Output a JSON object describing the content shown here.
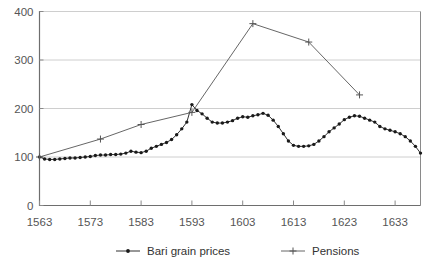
{
  "chart_data": {
    "type": "line",
    "title": "",
    "xlabel": "",
    "ylabel": "",
    "xlim": [
      1563,
      1638
    ],
    "ylim": [
      0,
      400
    ],
    "grid": true,
    "legend_position": "bottom",
    "yticks": [
      0,
      100,
      200,
      300,
      400
    ],
    "ytick_labels": [
      "0",
      "100",
      "200",
      "300",
      "400"
    ],
    "xticks": [
      1563,
      1573,
      1583,
      1593,
      1603,
      1613,
      1623,
      1633
    ],
    "xtick_labels": [
      "1563",
      "1573",
      "1583",
      "1593",
      "1603",
      "1613",
      "1623",
      "1633"
    ],
    "series": [
      {
        "name": "Bari grain prices",
        "marker": "dot",
        "color": "#1a1a1a",
        "x": [
          1563,
          1564,
          1565,
          1566,
          1567,
          1568,
          1569,
          1570,
          1571,
          1572,
          1573,
          1574,
          1575,
          1576,
          1577,
          1578,
          1579,
          1580,
          1581,
          1582,
          1583,
          1584,
          1585,
          1586,
          1587,
          1588,
          1589,
          1590,
          1591,
          1592,
          1593,
          1594,
          1595,
          1596,
          1597,
          1598,
          1599,
          1600,
          1601,
          1602,
          1603,
          1604,
          1605,
          1606,
          1607,
          1608,
          1609,
          1610,
          1611,
          1612,
          1613,
          1614,
          1615,
          1616,
          1617,
          1618,
          1619,
          1620,
          1621,
          1622,
          1623,
          1624,
          1625,
          1626,
          1627,
          1628,
          1629,
          1630,
          1631,
          1632,
          1633,
          1634,
          1635,
          1636,
          1637,
          1638
        ],
        "values": [
          100,
          96,
          95,
          95,
          96,
          97,
          98,
          98,
          99,
          100,
          101,
          103,
          104,
          104,
          105,
          105,
          106,
          108,
          112,
          110,
          109,
          112,
          118,
          122,
          126,
          130,
          136,
          146,
          158,
          172,
          208,
          196,
          189,
          180,
          172,
          170,
          170,
          172,
          175,
          180,
          183,
          182,
          185,
          187,
          190,
          186,
          176,
          163,
          148,
          133,
          124,
          122,
          122,
          123,
          126,
          133,
          142,
          152,
          160,
          168,
          177,
          182,
          185,
          184,
          180,
          176,
          172,
          163,
          158,
          155,
          152,
          148,
          142,
          133,
          122,
          108
        ]
      },
      {
        "name": "Pensions",
        "marker": "plus",
        "color": "#555555",
        "x": [
          1563,
          1575,
          1583,
          1593,
          1605,
          1616,
          1626
        ],
        "values": [
          100,
          137,
          167,
          192,
          375,
          337,
          228
        ]
      }
    ]
  },
  "legend": {
    "items": [
      {
        "label": "Bari grain prices",
        "marker": "dot"
      },
      {
        "label": "Pensions",
        "marker": "plus"
      }
    ]
  }
}
